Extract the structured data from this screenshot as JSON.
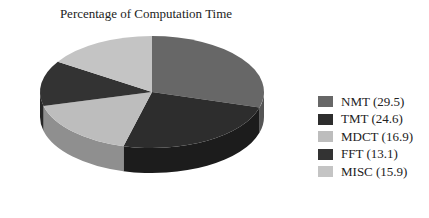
{
  "chart_data": {
    "type": "pie",
    "title": "Percentage of Computation Time",
    "style": "3d",
    "categories": [
      "NMT",
      "TMT",
      "MDCT",
      "FFT",
      "MISC"
    ],
    "values": [
      29.5,
      24.6,
      16.9,
      13.1,
      15.9
    ],
    "legend_labels": [
      "NMT (29.5)",
      "TMT (24.6)",
      "MDCT (16.9)",
      "FFT (13.1)",
      "MISC (15.9)"
    ],
    "colors": [
      "#676767",
      "#2d2d2d",
      "#bdbdbd",
      "#333333",
      "#c4c4c4"
    ],
    "side_colors": [
      "#555555",
      "#1c1c1c",
      "#8f8f8f",
      "#262626",
      "#9a9a9a"
    ],
    "legend_position": "right",
    "start_angle": "12 o'clock",
    "direction": "clockwise"
  },
  "legend": {
    "items": [
      {
        "label": "NMT (29.5)",
        "color": "#676767"
      },
      {
        "label": "TMT (24.6)",
        "color": "#2d2d2d"
      },
      {
        "label": "MDCT (16.9)",
        "color": "#bdbdbd"
      },
      {
        "label": "FFT (13.1)",
        "color": "#333333"
      },
      {
        "label": "MISC (15.9)",
        "color": "#c4c4c4"
      }
    ]
  }
}
